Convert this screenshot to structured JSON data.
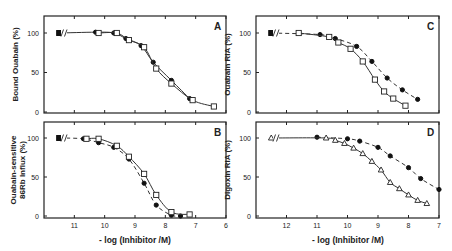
{
  "chart_data": [
    {
      "panel": "A",
      "type": "line",
      "title": "",
      "ylabel": "Bound Ouabain (%)",
      "xlabel": "",
      "ylim": [
        0,
        100
      ],
      "yticks": [
        0,
        50,
        100
      ],
      "xlim": [
        12,
        6
      ],
      "xticks": [
        11,
        10,
        9,
        8,
        7,
        6
      ],
      "show_xtick_labels": false,
      "axis_break": true,
      "series": [
        {
          "name": "filled circles",
          "marker": "circle-filled",
          "line": "solid",
          "x": [
            11.5,
            10.3,
            9.7,
            9.3,
            8.8,
            8.4,
            7.8,
            7.2
          ],
          "y": [
            100,
            101,
            100,
            93,
            84,
            63,
            40,
            17
          ]
        },
        {
          "name": "open squares",
          "marker": "square-open",
          "line": "solid",
          "x": [
            10.2,
            9.6,
            9.2,
            8.7,
            8.3,
            7.8,
            7.1,
            6.4
          ],
          "y": [
            100,
            100,
            91,
            82,
            55,
            36,
            15,
            7
          ]
        }
      ]
    },
    {
      "panel": "B",
      "type": "line",
      "title": "",
      "ylabel": "Ouabain-sensitive 86Rb Influx (%)",
      "xlabel": "- log (Inhibitor /M)",
      "ylim": [
        0,
        100
      ],
      "yticks": [
        0,
        50,
        100
      ],
      "xlim": [
        12,
        6
      ],
      "xticks": [
        11,
        10,
        9,
        8,
        7,
        6
      ],
      "show_xtick_labels": true,
      "axis_break": true,
      "series": [
        {
          "name": "filled circles",
          "marker": "circle-filled",
          "line": "dashed",
          "x": [
            11.5,
            10.7,
            10.2,
            9.7,
            9.2,
            8.7,
            8.3,
            7.8,
            7.5
          ],
          "y": [
            100,
            99,
            94,
            88,
            73,
            42,
            14,
            1,
            0
          ]
        },
        {
          "name": "open squares",
          "marker": "square-open",
          "line": "solid",
          "x": [
            10.6,
            10.2,
            9.6,
            9.2,
            8.7,
            8.3,
            7.8,
            7.2
          ],
          "y": [
            99,
            99,
            90,
            76,
            54,
            27,
            5,
            2
          ]
        }
      ]
    },
    {
      "panel": "C",
      "type": "line",
      "title": "",
      "ylabel": "Ouabain RIA (%)",
      "xlabel": "",
      "ylim": [
        0,
        100
      ],
      "yticks": [
        0,
        50,
        100
      ],
      "xlim": [
        13,
        7
      ],
      "xticks": [
        12,
        11,
        10,
        9,
        8,
        7
      ],
      "show_xtick_labels": false,
      "axis_break": true,
      "series": [
        {
          "name": "filled circles",
          "marker": "circle-filled",
          "line": "dashed",
          "x": [
            12.5,
            10.9,
            10.4,
            9.7,
            9.2,
            8.7,
            8.2,
            7.7
          ],
          "y": [
            100,
            98,
            93,
            83,
            64,
            43,
            28,
            16
          ]
        },
        {
          "name": "open squares",
          "marker": "square-open",
          "line": "solid",
          "x": [
            11.6,
            10.6,
            10.3,
            9.9,
            9.5,
            9.1,
            8.8,
            8.5,
            8.1
          ],
          "y": [
            100,
            95,
            88,
            80,
            64,
            41,
            26,
            17,
            8
          ]
        }
      ]
    },
    {
      "panel": "D",
      "type": "line",
      "title": "",
      "ylabel": "Digoxin RIA (%)",
      "xlabel": "- log (Inhibitor /M)",
      "ylim": [
        0,
        100
      ],
      "yticks": [
        0,
        50,
        100
      ],
      "xlim": [
        13,
        7
      ],
      "xticks": [
        12,
        11,
        10,
        9,
        8,
        7
      ],
      "show_xtick_labels": true,
      "axis_break": true,
      "series": [
        {
          "name": "filled circles",
          "marker": "circle-filled",
          "line": "dashed",
          "x": [
            11.0,
            10.0,
            9.6,
            9.0,
            8.6,
            8.0,
            7.6,
            7.0
          ],
          "y": [
            101,
            99,
            96,
            88,
            77,
            62,
            48,
            34
          ]
        },
        {
          "name": "open triangles",
          "marker": "triangle-open",
          "line": "solid",
          "x": [
            12.5,
            10.7,
            10.4,
            10.1,
            9.8,
            9.5,
            9.2,
            8.9,
            8.6,
            8.3,
            8.0,
            7.7,
            7.4
          ],
          "y": [
            100,
            100,
            97,
            93,
            87,
            80,
            70,
            59,
            43,
            35,
            27,
            20,
            16
          ]
        }
      ]
    }
  ],
  "figure": {
    "panel_letters": [
      "A",
      "B",
      "C",
      "D"
    ],
    "x_axis_title_left": "- log (Inhibitor /M)",
    "x_axis_title_right": "- log (Inhibitor /M)"
  }
}
